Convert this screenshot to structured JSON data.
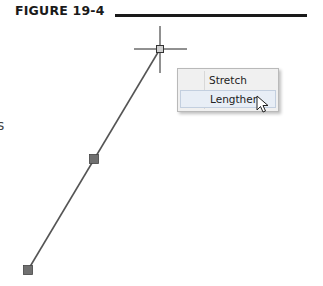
{
  "figure": {
    "label": "FIGURE 19-4"
  },
  "edge_fragment": "s",
  "drawing": {
    "line": {
      "x1": 28,
      "y1": 270,
      "x2": 160,
      "y2": 49,
      "color": "#555555"
    },
    "grips": [
      {
        "name": "start-grip",
        "x": 28,
        "y": 270
      },
      {
        "name": "midpoint-grip",
        "x": 94,
        "y": 159
      },
      {
        "name": "end-grip-hover",
        "x": 160,
        "y": 49
      }
    ],
    "crosshair": {
      "x": 160,
      "y": 49
    }
  },
  "context_menu": {
    "items": [
      {
        "label": "Stretch"
      },
      {
        "label": "Lengthen",
        "hovered": true
      }
    ]
  },
  "colors": {
    "grip_fill": "#707070",
    "menu_bg": "#f0f0f0",
    "hover_bg": "#e8eef6"
  }
}
